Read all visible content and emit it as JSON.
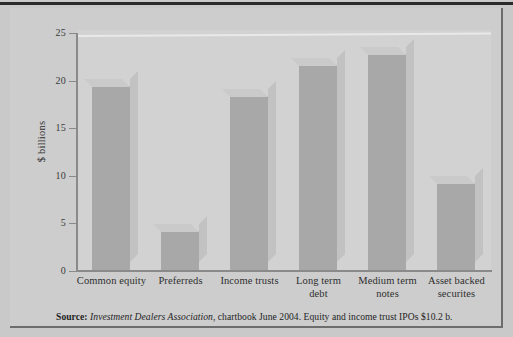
{
  "figure": {
    "y_axis_title": "$ billions",
    "source_prefix": "Source:",
    "source_italic": "Investment Dealers Association",
    "source_rest": ", chartbook June 2004. Equity and income trust IPOs $10.2 b."
  },
  "chart_data": {
    "type": "bar",
    "title": "",
    "xlabel": "",
    "ylabel": "$ billions",
    "ylim": [
      0,
      25
    ],
    "yticks": [
      0,
      5,
      10,
      15,
      20,
      25
    ],
    "ytick_labels": [
      "0",
      "5",
      "10",
      "15",
      "20",
      "25"
    ],
    "grid": false,
    "legend": "none",
    "categories": [
      "Common equity",
      "Preferreds",
      "Income trusts",
      "Long term debt",
      "Medium term notes",
      "Asset backed securites"
    ],
    "category_lines": [
      [
        "Common equity"
      ],
      [
        "Preferreds"
      ],
      [
        "Income trusts"
      ],
      [
        "Long term",
        "debt"
      ],
      [
        "Medium term",
        "notes"
      ],
      [
        "Asset backed",
        "securites"
      ]
    ],
    "values": [
      19.2,
      4.0,
      18.2,
      21.4,
      22.6,
      9.0
    ],
    "bar_color": "#a8a8a8",
    "plot_background": "#d2d2d2",
    "figure_background": "#cdcdcd"
  }
}
